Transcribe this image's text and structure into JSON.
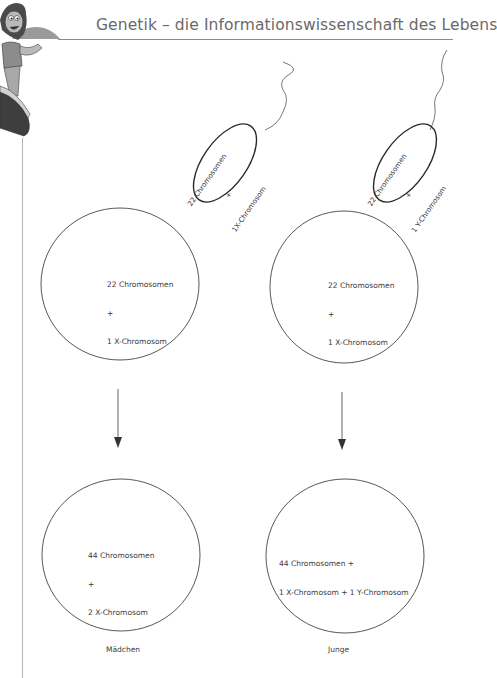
{
  "header": {
    "title": "Genetik – die Informationswissenschaft des Lebens"
  },
  "illustration": {
    "icon": "girl-on-slide-mascot"
  },
  "sperm_cells": [
    {
      "id": "sperm-x",
      "line1": "22 Chromosomen",
      "line2": "+",
      "line3": "1X-Chromosom"
    },
    {
      "id": "sperm-y",
      "line1": "22 Chromosomen",
      "line2": "+",
      "line3": "1 Y-Chromosom"
    }
  ],
  "egg_cells": [
    {
      "id": "egg-left",
      "line1": "22 Chromosomen",
      "line2": "+",
      "line3": "1 X-Chromosom"
    },
    {
      "id": "egg-right",
      "line1": "22 Chromosomen",
      "line2": "+",
      "line3": "1 X-Chromosom"
    }
  ],
  "zygotes": [
    {
      "id": "zygote-girl",
      "line1": "44 Chromosomen",
      "line2": "+",
      "line3": "2 X-Chromosom",
      "caption": "Mädchen"
    },
    {
      "id": "zygote-boy",
      "line1": "44 Chromosomen +",
      "line2": "1 X-Chromosom + 1 Y-Chromosom",
      "caption": "Junge"
    }
  ],
  "arrows": [
    {
      "id": "arrow-left",
      "icon": "arrow-down-icon"
    },
    {
      "id": "arrow-right",
      "icon": "arrow-down-icon"
    }
  ]
}
